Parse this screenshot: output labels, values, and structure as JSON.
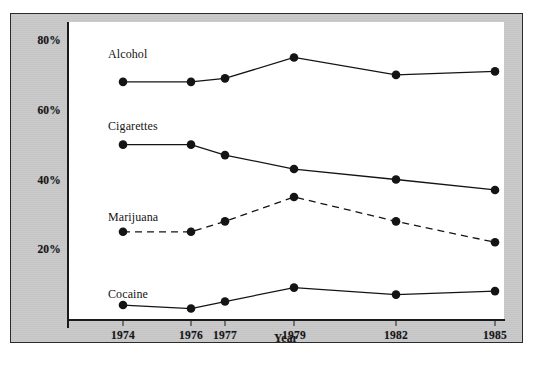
{
  "figure": {
    "background_color": "#c8c8c8",
    "panel_color": "#ffffff",
    "border_color": "#2b2b2b"
  },
  "caption": "",
  "chart_data": {
    "type": "line",
    "title": "",
    "xlabel": "Year",
    "ylabel": "",
    "categories": [
      "1974",
      "1976",
      "1977",
      "1979",
      "1982",
      "1985"
    ],
    "x_positions": [
      90,
      158,
      192,
      261,
      363,
      462
    ],
    "ylim": [
      0,
      80
    ],
    "ytick_labels": [
      "80%",
      "60%",
      "40%",
      "20%"
    ],
    "ytick_values": [
      80,
      60,
      40,
      20
    ],
    "grid": false,
    "legend_position": "inline-labels",
    "marker": "filled-circle",
    "series": [
      {
        "name": "Alcohol",
        "values": [
          68,
          68,
          69,
          75,
          70,
          71
        ],
        "line_style": "solid",
        "color": "#141414",
        "label_x": 75,
        "label_y": 48
      },
      {
        "name": "Cigarettes",
        "values": [
          50,
          50,
          47,
          43,
          40,
          37
        ],
        "line_style": "solid",
        "color": "#141414",
        "label_x": 75,
        "label_y": 120
      },
      {
        "name": "Marijuana",
        "values": [
          25,
          25,
          28,
          35,
          28,
          22
        ],
        "line_style": "dashed",
        "color": "#141414",
        "label_x": 75,
        "label_y": 211
      },
      {
        "name": "Cocaine",
        "values": [
          4,
          3,
          5,
          9,
          7,
          8
        ],
        "line_style": "solid",
        "color": "#141414",
        "label_x": 75,
        "label_y": 288
      }
    ]
  }
}
